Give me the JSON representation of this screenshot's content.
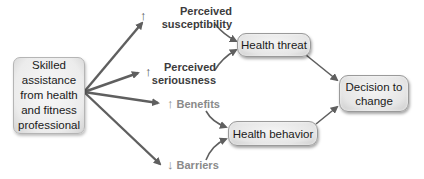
{
  "diagram": {
    "type": "flow",
    "source": {
      "text": "Skilled assistance from health and fitness professional"
    },
    "factors": [
      {
        "id": "susceptibility",
        "direction": "↑",
        "line1": "Perceived",
        "line2": "susceptibility",
        "leads_to": "health_threat"
      },
      {
        "id": "seriousness",
        "direction": "↑",
        "line1": "Perceived",
        "line2": "seriousness",
        "leads_to": "health_threat"
      },
      {
        "id": "benefits",
        "direction": "↑",
        "label": "Benefits",
        "leads_to": "health_behavior"
      },
      {
        "id": "barriers",
        "direction": "↓",
        "label": "Barriers",
        "leads_to": "health_behavior"
      }
    ],
    "nodes": {
      "health_threat": "Health threat",
      "health_behavior": "Health behavior",
      "decision": "Decision to change"
    },
    "colors": {
      "arrow": "#5f5f5f",
      "box_fill": "#e6e6e6",
      "box_border": "#9a9a9a",
      "dark_label": "#3c3c3c",
      "light_label": "#8a8a8a"
    }
  }
}
